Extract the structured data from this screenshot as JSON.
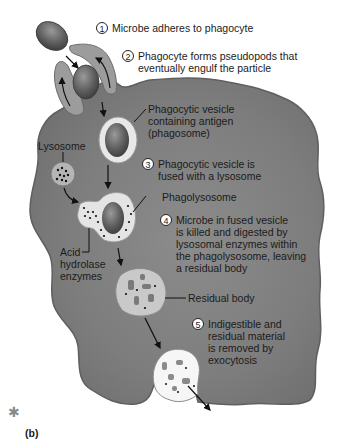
{
  "figure": {
    "panel_label": "(b)",
    "colors": {
      "cell_body": "#8e8e8e",
      "cell_edge": "#6f6f6f",
      "microbe": "#5c5c5c",
      "vesicle_ring": "#e6e6e6",
      "enzyme_dot": "#1a1a1a",
      "background": "#ffffff"
    },
    "steps": [
      {
        "number": "1",
        "lines": [
          "Microbe adheres to phagocyte"
        ]
      },
      {
        "number": "2",
        "lines": [
          "Phagocyte forms pseudopods that",
          "eventually engulf the particle"
        ]
      },
      {
        "number": "3",
        "lines": [
          "Phagocytic vesicle is",
          "fused with a lysosome"
        ]
      },
      {
        "number": "4",
        "lines": [
          "Microbe in fused vesicle",
          "is killed and digested by",
          "lysosomal enzymes within",
          "the phagolysosome, leaving",
          "a residual body"
        ]
      },
      {
        "number": "5",
        "lines": [
          "Indigestible and",
          "residual material",
          "is removed by",
          "exocytosis"
        ]
      }
    ],
    "labels": {
      "phagosome": [
        "Phagocytic vesicle",
        "containing antigen",
        "(phagosome)"
      ],
      "lysosome": "Lysosome",
      "phagolysosome": "Phagolysosome",
      "acid_hydrolase": [
        "Acid",
        "hydrolase",
        "enzymes"
      ],
      "residual_body": "Residual body"
    },
    "decor": {
      "star_glyph": "✱"
    }
  }
}
